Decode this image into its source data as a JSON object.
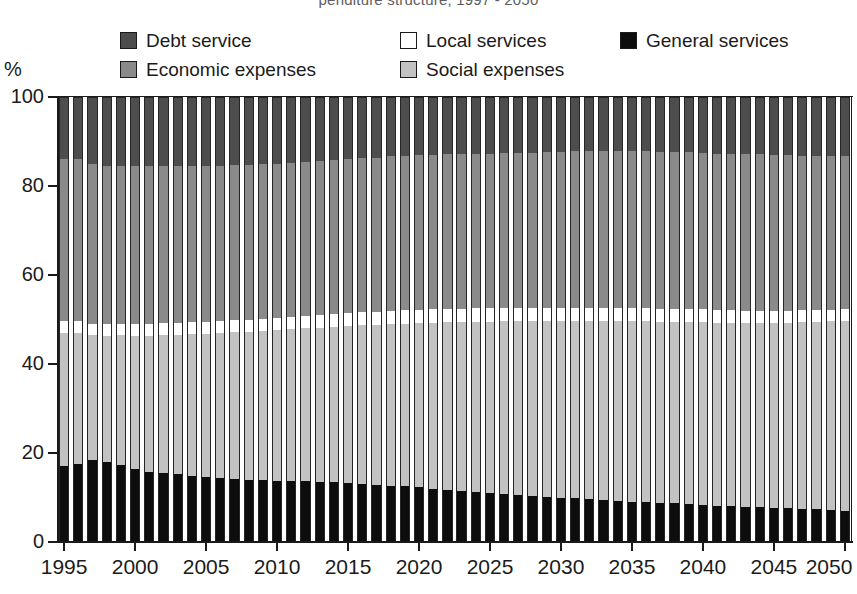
{
  "title": "penditure structure, 1997 - 2050",
  "axis": {
    "y_unit": "%",
    "y_ticks": [
      0,
      20,
      40,
      60,
      80,
      100
    ],
    "x_ticks": [
      1995,
      2000,
      2005,
      2010,
      2015,
      2020,
      2025,
      2030,
      2035,
      2040,
      2045,
      2050
    ]
  },
  "legend": {
    "rows": [
      [
        {
          "label": "Debt service",
          "key": "debt_service",
          "color": "#4d4d4d"
        },
        {
          "label": "Local services",
          "key": "local_services",
          "color": "#ffffff"
        },
        {
          "label": "General services",
          "key": "general_services",
          "color": "#0d0d0d"
        }
      ],
      [
        {
          "label": "Economic expenses",
          "key": "economic_expenses",
          "color": "#8a8a8a"
        },
        {
          "label": "Social expenses",
          "key": "social_expenses",
          "color": "#c2c2c2"
        }
      ]
    ]
  },
  "chart_data": {
    "type": "bar",
    "subtype": "stacked-100-percent-column",
    "title": "penditure structure, 1997 - 2050",
    "xlabel": "",
    "ylabel": "%",
    "ylim": [
      0,
      100
    ],
    "grid": false,
    "legend_position": "top",
    "stack_order_bottom_to_top": [
      "general_services",
      "social_expenses",
      "local_services",
      "economic_expenses",
      "debt_service"
    ],
    "colors": {
      "general_services": "#0d0d0d",
      "social_expenses": "#c2c2c2",
      "local_services": "#ffffff",
      "economic_expenses": "#8a8a8a",
      "debt_service": "#4d4d4d"
    },
    "categories": [
      1995,
      1996,
      1997,
      1998,
      1999,
      2000,
      2001,
      2002,
      2003,
      2004,
      2005,
      2006,
      2007,
      2008,
      2009,
      2010,
      2011,
      2012,
      2013,
      2014,
      2015,
      2016,
      2017,
      2018,
      2019,
      2020,
      2021,
      2022,
      2023,
      2024,
      2025,
      2026,
      2027,
      2028,
      2029,
      2030,
      2031,
      2032,
      2033,
      2034,
      2035,
      2036,
      2037,
      2038,
      2039,
      2040,
      2041,
      2042,
      2043,
      2044,
      2045,
      2046,
      2047,
      2048,
      2049,
      2050
    ],
    "series": [
      {
        "name": "General services",
        "key": "general_services",
        "values": [
          17.0,
          17.6,
          18.4,
          18.0,
          17.3,
          16.3,
          15.8,
          15.5,
          15.2,
          14.9,
          14.6,
          14.4,
          14.2,
          14.0,
          13.9,
          13.8,
          13.7,
          13.6,
          13.5,
          13.4,
          13.3,
          13.1,
          12.9,
          12.7,
          12.5,
          12.3,
          12.0,
          11.8,
          11.5,
          11.3,
          11.0,
          10.8,
          10.6,
          10.4,
          10.2,
          10.0,
          9.8,
          9.6,
          9.5,
          9.3,
          9.1,
          9.0,
          8.8,
          8.7,
          8.5,
          8.4,
          8.2,
          8.1,
          7.9,
          7.8,
          7.7,
          7.6,
          7.5,
          7.4,
          7.2,
          7.0
        ]
      },
      {
        "name": "Social expenses",
        "key": "social_expenses",
        "values": [
          30.0,
          29.4,
          28.1,
          28.4,
          29.2,
          30.0,
          30.6,
          31.0,
          31.4,
          31.8,
          32.2,
          32.5,
          32.9,
          33.2,
          33.5,
          33.8,
          34.1,
          34.4,
          34.7,
          35.0,
          35.3,
          35.6,
          35.9,
          36.3,
          36.6,
          36.9,
          37.3,
          37.6,
          37.9,
          38.2,
          38.5,
          38.8,
          39.0,
          39.2,
          39.5,
          39.7,
          39.9,
          40.1,
          40.2,
          40.4,
          40.5,
          40.6,
          40.7,
          40.8,
          40.9,
          41.0,
          41.1,
          41.2,
          41.3,
          41.4,
          41.5,
          41.7,
          41.9,
          42.1,
          42.4,
          42.7
        ]
      },
      {
        "name": "Local services",
        "key": "local_services",
        "values": [
          2.6,
          2.6,
          2.6,
          2.6,
          2.6,
          2.6,
          2.6,
          2.7,
          2.7,
          2.7,
          2.7,
          2.7,
          2.7,
          2.8,
          2.8,
          2.8,
          2.8,
          2.8,
          2.9,
          2.9,
          2.9,
          2.9,
          2.9,
          3.0,
          3.0,
          3.0,
          3.0,
          3.0,
          3.0,
          3.0,
          3.0,
          3.0,
          3.0,
          3.0,
          3.0,
          3.0,
          3.0,
          3.0,
          3.0,
          3.0,
          3.0,
          2.9,
          2.9,
          2.9,
          2.9,
          2.9,
          2.8,
          2.8,
          2.8,
          2.8,
          2.7,
          2.7,
          2.7,
          2.6,
          2.6,
          2.6
        ]
      },
      {
        "name": "Economic expenses",
        "key": "economic_expenses",
        "values": [
          36.4,
          36.4,
          35.9,
          35.5,
          35.4,
          35.6,
          35.5,
          35.4,
          35.3,
          35.2,
          35.1,
          35.0,
          34.9,
          34.8,
          34.7,
          34.6,
          34.6,
          34.6,
          34.6,
          34.6,
          34.6,
          34.7,
          34.7,
          34.7,
          34.7,
          34.7,
          34.7,
          34.7,
          34.8,
          34.8,
          34.8,
          34.8,
          34.8,
          34.9,
          34.9,
          35.0,
          35.1,
          35.1,
          35.2,
          35.2,
          35.3,
          35.3,
          35.3,
          35.3,
          35.3,
          35.2,
          35.2,
          35.2,
          35.2,
          35.1,
          35.0,
          34.9,
          34.7,
          34.6,
          34.5,
          34.4
        ]
      },
      {
        "name": "Debt service",
        "key": "debt_service",
        "values": [
          14.0,
          14.0,
          15.0,
          15.5,
          15.5,
          15.5,
          15.5,
          15.4,
          15.4,
          15.4,
          15.4,
          15.4,
          15.3,
          15.2,
          15.1,
          15.0,
          14.8,
          14.6,
          14.3,
          14.1,
          13.9,
          13.7,
          13.6,
          13.3,
          13.2,
          13.1,
          13.0,
          12.9,
          12.8,
          12.7,
          12.7,
          12.6,
          12.6,
          12.5,
          12.4,
          12.3,
          12.2,
          12.2,
          12.1,
          12.1,
          12.1,
          12.2,
          12.3,
          12.3,
          12.4,
          12.5,
          12.7,
          12.7,
          12.8,
          12.9,
          13.1,
          13.1,
          13.2,
          13.3,
          13.3,
          13.3
        ]
      }
    ]
  }
}
